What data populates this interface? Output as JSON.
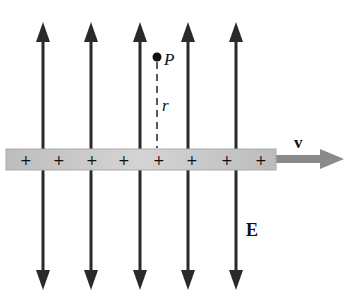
{
  "diagram": {
    "labels": {
      "point": "P",
      "distance": "r",
      "velocity": "v",
      "field": "E"
    },
    "charge_sign": "+",
    "charge_count": 8,
    "field_line_count": 5,
    "colors": {
      "field_line": "#2a2a2a",
      "rod_fill": "#c4c4c4",
      "rod_edge": "#a8a8a8",
      "velocity_arrow": "#8a8a8a",
      "text": "#111111",
      "background": "#ffffff"
    }
  }
}
